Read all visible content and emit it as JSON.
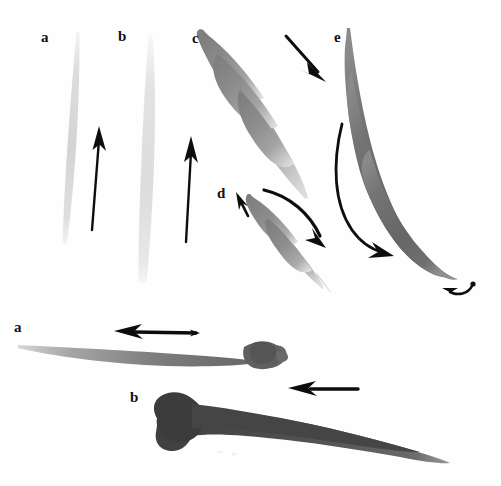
{
  "figure": {
    "width": 501,
    "height": 486,
    "background_color": "#fefefe",
    "ink_color": "#0d0d0d"
  },
  "panels": [
    {
      "id": "panel-top",
      "labels": [
        {
          "key": "a",
          "text": "a",
          "x": 41,
          "y": 30
        },
        {
          "key": "b",
          "text": "b",
          "x": 118,
          "y": 29
        },
        {
          "key": "c",
          "text": "c",
          "x": 192,
          "y": 31
        },
        {
          "key": "d",
          "text": "d",
          "x": 217,
          "y": 186
        },
        {
          "key": "e",
          "text": "e",
          "x": 334,
          "y": 30
        }
      ],
      "strokes": [
        {
          "key": "a",
          "label": "a",
          "kind": "vertical-hairline-taper",
          "tone": "#dcdcdc",
          "direction": "upward"
        },
        {
          "key": "b",
          "label": "b",
          "kind": "vertical-broad-taper",
          "tone": "#e2e2e2",
          "direction": "upward"
        },
        {
          "key": "c",
          "label": "c",
          "kind": "diagonal-leaf",
          "tone": "#8e8e8e",
          "direction": "down-right"
        },
        {
          "key": "d",
          "label": "d",
          "kind": "short-diagonal-leaf",
          "tone": "#8a8a8a",
          "direction": "down-right-then-back"
        },
        {
          "key": "e",
          "label": "e",
          "kind": "long-curved-sweep",
          "tone": "#6f6f6f",
          "direction": "down-right-with-hook"
        }
      ],
      "arrows": [
        {
          "key": "arrow-a",
          "points_to": "a",
          "style": "straight",
          "direction": "up"
        },
        {
          "key": "arrow-b",
          "points_to": "b",
          "style": "straight",
          "direction": "up"
        },
        {
          "key": "arrow-c",
          "points_to": "c",
          "style": "straight",
          "direction": "down-right"
        },
        {
          "key": "arrow-d-up",
          "points_to": "d",
          "style": "straight-short",
          "direction": "up-left"
        },
        {
          "key": "arrow-d-curve",
          "points_to": "d",
          "style": "curved",
          "direction": "down-right"
        },
        {
          "key": "arrow-e-sweep",
          "points_to": "e",
          "style": "curved-long",
          "direction": "down-right"
        },
        {
          "key": "arrow-e-hook",
          "points_to": "e",
          "style": "curved-hook",
          "direction": "left"
        }
      ]
    },
    {
      "id": "panel-bot",
      "labels": [
        {
          "key": "a",
          "text": "a",
          "x": 14,
          "y": 320
        },
        {
          "key": "b",
          "text": "b",
          "x": 130,
          "y": 390
        }
      ],
      "strokes": [
        {
          "key": "a",
          "label": "a",
          "kind": "horizontal-taper-with-blunt-head",
          "tone": "#6d6d6d",
          "direction": "right-to-left"
        },
        {
          "key": "b",
          "label": "b",
          "kind": "horizontal-heavy-wedge",
          "tone": "#4a4a4a",
          "direction": "right-to-left"
        }
      ],
      "arrows": [
        {
          "key": "arrow-bot-a",
          "points_to": "a",
          "style": "double-headed",
          "direction": "left"
        },
        {
          "key": "arrow-bot-b",
          "points_to": "b",
          "style": "straight",
          "direction": "left"
        }
      ]
    }
  ]
}
